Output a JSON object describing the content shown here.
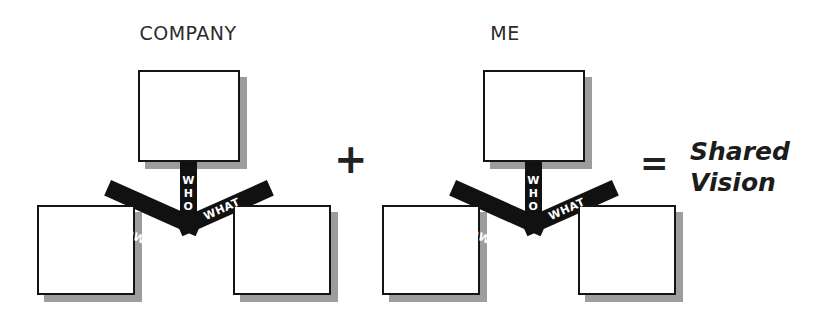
{
  "canvas": {
    "width": 819,
    "height": 333,
    "background": "#ffffff"
  },
  "palette": {
    "ink": "#141414",
    "connector": "#111111",
    "shadow": "#9d9d9d",
    "node_fill": "#ffffff",
    "label_text": "#ffffff",
    "heading": "#2b2b2b"
  },
  "equation": {
    "plus_symbol": "+",
    "equals_symbol": "=",
    "result_line_1": "Shared",
    "result_line_2": "Vision"
  },
  "diagrams": [
    {
      "id": "company",
      "title": "COMPANY",
      "nodes": [
        {
          "position": "top",
          "label": ""
        },
        {
          "position": "bottom-left",
          "label": ""
        },
        {
          "position": "bottom-right",
          "label": ""
        }
      ],
      "connector_labels": {
        "stem": "WHO",
        "stem_letters": [
          "W",
          "H",
          "O"
        ],
        "left_arm": "HOW",
        "right_arm": "WHAT"
      }
    },
    {
      "id": "me",
      "title": "ME",
      "nodes": [
        {
          "position": "top",
          "label": ""
        },
        {
          "position": "bottom-left",
          "label": ""
        },
        {
          "position": "bottom-right",
          "label": ""
        }
      ],
      "connector_labels": {
        "stem": "WHO",
        "stem_letters": [
          "W",
          "H",
          "O"
        ],
        "left_arm": "HOW",
        "right_arm": "WHAT"
      }
    }
  ]
}
